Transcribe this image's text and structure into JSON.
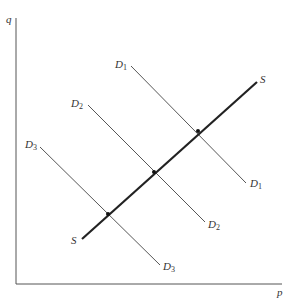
{
  "axes": {
    "y_label": "q",
    "x_label": "p",
    "color": "#555555"
  },
  "supply": {
    "label": "S",
    "color": "#222222",
    "x1": 82,
    "y1": 239,
    "x2": 257,
    "y2": 82
  },
  "demand": [
    {
      "name": "D",
      "sub": "1",
      "x1": 131,
      "y1": 66,
      "x2": 246,
      "y2": 183
    },
    {
      "name": "D",
      "sub": "2",
      "x1": 88,
      "y1": 105,
      "x2": 205,
      "y2": 222
    },
    {
      "name": "D",
      "sub": "3",
      "x1": 40,
      "y1": 147,
      "x2": 160,
      "y2": 265
    }
  ],
  "intersections": [
    {
      "curve": "D1",
      "x": 198,
      "y": 131
    },
    {
      "curve": "D2",
      "x": 154,
      "y": 172
    },
    {
      "curve": "D3",
      "x": 108,
      "y": 214
    }
  ],
  "colors": {
    "demand_line": "#444444",
    "supply_line": "#222222",
    "background": "#ffffff"
  }
}
